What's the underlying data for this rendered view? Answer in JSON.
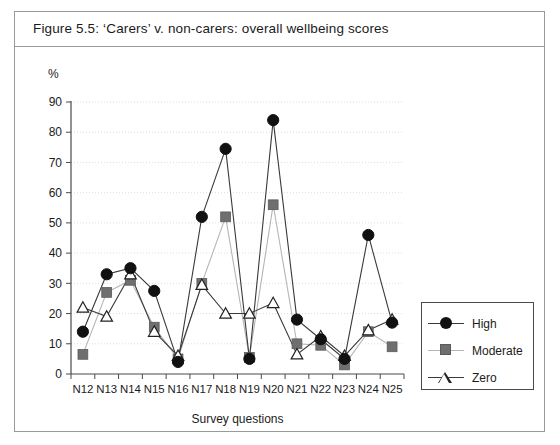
{
  "figure": {
    "title": "Figure 5.5:  ‘Carers’ v. non-carers: overall wellbeing scores"
  },
  "axes": {
    "y_unit_label": "%",
    "x_title": "Survey questions",
    "y_ticks": [
      "0",
      "10",
      "20",
      "30",
      "40",
      "50",
      "60",
      "70",
      "80",
      "90"
    ]
  },
  "legend": {
    "items": [
      {
        "label": "High",
        "marker": "filled-circle",
        "color": "#111111",
        "line_color": "#3a3a3a"
      },
      {
        "label": "Moderate",
        "marker": "filled-square",
        "color": "#6f6f6f",
        "line_color": "#b5b5b5"
      },
      {
        "label": "Zero",
        "marker": "open-triangle",
        "color": "#ffffff",
        "line_color": "#3a3a3a"
      }
    ]
  },
  "chart_data": {
    "type": "line",
    "title": "Figure 5.5:  ‘Carers’ v. non-carers: overall wellbeing scores",
    "xlabel": "Survey questions",
    "ylabel": "%",
    "ylim": [
      0,
      90
    ],
    "ytick_step": 10,
    "grid": true,
    "legend_position": "right",
    "categories": [
      "N12",
      "N13",
      "N14",
      "N15",
      "N16",
      "N17",
      "N18",
      "N19",
      "N20",
      "N21",
      "N22",
      "N23",
      "N24",
      "N25"
    ],
    "series": [
      {
        "name": "High",
        "values": [
          14,
          33,
          35,
          27.5,
          4,
          52,
          74.5,
          5,
          84,
          18,
          11.5,
          5,
          46,
          17
        ]
      },
      {
        "name": "Moderate",
        "values": [
          6.5,
          27,
          31,
          15.5,
          5,
          30,
          52,
          5.5,
          56,
          10,
          9.5,
          3,
          14,
          9
        ]
      },
      {
        "name": "Zero",
        "values": [
          22,
          19,
          33,
          14,
          6,
          29.5,
          20,
          20,
          23.5,
          6.5,
          12.5,
          6,
          14.5,
          18
        ]
      }
    ]
  }
}
